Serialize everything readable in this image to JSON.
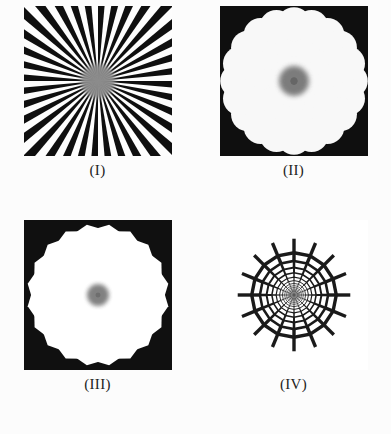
{
  "figure": {
    "background_color": "#fcfcfc",
    "ink_color": "#141414",
    "layout": "2x2 grid",
    "panel_count": 4
  },
  "panels": [
    {
      "id": "panel-1",
      "label": "(I)",
      "name": "radial-spoke-starburst",
      "description": "Siemens star: alternating black and white wedges radiating from a blurred gray center",
      "pattern_type": "spokes",
      "spoke_count": 36,
      "duty_cycle": 0.5,
      "center_blur_radius": 17,
      "center_gray": "#8a8a8a",
      "fill_color": "#141414",
      "background_color": "#f7f7f7",
      "size_px": [
        148,
        150
      ]
    },
    {
      "id": "panel-2",
      "label": "(II)",
      "name": "radial-dot-array-positive",
      "description": "White dots on black field arranged in concentric rings, dot diameter grows with radius",
      "pattern_type": "dots",
      "dots_per_ring": 20,
      "ring_count": 11,
      "ring_growth_ratio": 1.27,
      "dot_fill": "#f2f2f2",
      "field_color": "#141414",
      "center_blur_radius": 15,
      "center_gray": "#6f6f6f",
      "size_px": [
        148,
        150
      ]
    },
    {
      "id": "panel-3",
      "label": "(III)",
      "name": "radial-cell-array-negative",
      "description": "White polygonal cells separated by thin black webbing, cells grow with radius",
      "pattern_type": "cells",
      "cells_per_ring": 20,
      "ring_count": 12,
      "ring_growth_ratio": 1.26,
      "cell_fill": "#fbfbfb",
      "line_color": "#141414",
      "center_blur_radius": 11,
      "center_gray": "#777777",
      "size_px": [
        148,
        150
      ]
    },
    {
      "id": "panel-4",
      "label": "(IV)",
      "name": "spider-web-grid",
      "description": "Polar grid: straight radial spokes crossed by concentric polygonal rings, stroke width increases with radius, spokes overshoot outermost ring",
      "pattern_type": "web",
      "spoke_count": 16,
      "ring_count": 13,
      "ring_growth_ratio": 1.24,
      "stroke_min": 0.35,
      "stroke_max": 3.4,
      "line_color": "#1a1a1a",
      "background_color": "#ffffff",
      "spoke_overshoot": 14,
      "size_px": [
        148,
        150
      ]
    }
  ]
}
